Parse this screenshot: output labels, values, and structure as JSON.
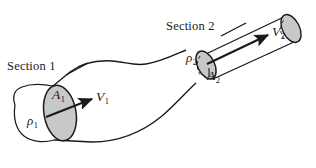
{
  "figure": {
    "background_color": "#ffffff",
    "line_color": "#1a1a1a",
    "cap_fill_color": "#c8c8c8",
    "width": 316,
    "height": 168
  },
  "labels": {
    "section1": "Section 1",
    "section2": "Section 2",
    "area1": "A",
    "area1_sub": "1",
    "area2": "A",
    "area2_sub": "2",
    "velocity1": "V",
    "velocity1_sub": "1",
    "velocity2": "V",
    "velocity2_sub": "2",
    "density1": "ρ",
    "density1_sub": "1",
    "density2": "ρ",
    "density2_sub": "2"
  },
  "icons": {
    "velocity1_arrow": "arrow-right-icon",
    "velocity2_arrow": "arrow-right-icon",
    "section1_leader": "leader-line-icon",
    "section2_leader": "leader-line-icon",
    "area2_leader": "leader-line-icon"
  }
}
